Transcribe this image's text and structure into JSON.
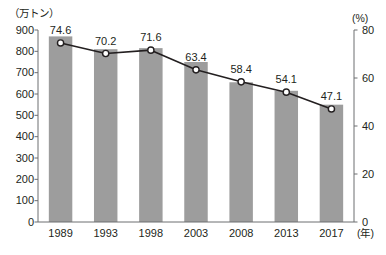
{
  "chart_data": {
    "type": "bar",
    "title": "",
    "subtitle": "",
    "categories": [
      "1989",
      "1993",
      "1998",
      "2003",
      "2008",
      "2013",
      "2017"
    ],
    "xlabel": "(年)",
    "grid": false,
    "legend": null,
    "series": [
      {
        "name": "生産量",
        "type": "bar",
        "unit": "（万トン）",
        "axis": "left",
        "values": [
          870,
          810,
          815,
          750,
          655,
          615,
          550
        ],
        "color": "#9d9d9d"
      },
      {
        "name": "割合",
        "type": "line",
        "unit": "(%)",
        "axis": "right",
        "values": [
          74.6,
          70.2,
          71.6,
          63.4,
          58.4,
          54.1,
          47.1
        ],
        "labels": [
          "74.6",
          "70.2",
          "71.6",
          "63.4",
          "58.4",
          "54.1",
          "47.1"
        ],
        "color": "#231f20",
        "marker": "open-circle"
      }
    ],
    "left_axis": {
      "unit_label": "（万トン）",
      "ticks": [
        "900",
        "800",
        "700",
        "600",
        "500",
        "400",
        "300",
        "200",
        "100",
        "0"
      ],
      "tick_values": [
        900,
        800,
        700,
        600,
        500,
        400,
        300,
        200,
        100,
        0
      ],
      "min": 0,
      "max": 900
    },
    "right_axis": {
      "unit_label": "(%)",
      "ticks": [
        "80",
        "60",
        "40",
        "20",
        "0"
      ],
      "tick_values": [
        80,
        60,
        40,
        20,
        0
      ],
      "min": 0,
      "max": 80
    }
  },
  "colors": {
    "bar_fill": "#9d9d9d",
    "line_stroke": "#231f20",
    "marker_fill": "#ffffff",
    "axis": "#6d6e71",
    "text": "#231f20",
    "background": "#ffffff"
  }
}
